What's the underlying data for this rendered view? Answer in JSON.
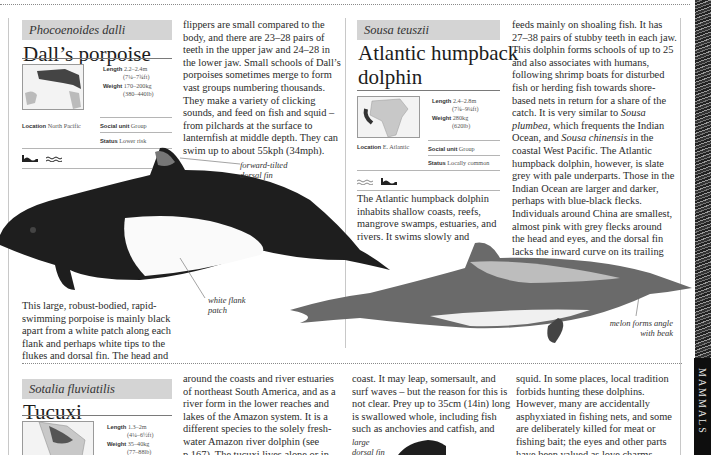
{
  "section_tab": "MAMMALS",
  "species": [
    {
      "scientific_name": "Phocoenoides dalli",
      "common_name": "Dall’s porpoise",
      "length_label": "Length",
      "length_value": "2.2–2.4m",
      "length_imperial": "(7¼–7¾ft)",
      "weight_label": "Weight",
      "weight_value": "170–200kg",
      "weight_imperial": "(380–440lb)",
      "location_label": "Location",
      "location_value": "North Pacific",
      "social_label": "Social unit",
      "social_value": "Group",
      "status_label": "Status",
      "status_value": "Lower risk",
      "habitat_icons": [
        "coast-icon",
        "open-sea-wave-icon"
      ],
      "text_left": "This large, robust-bodied, rapid-swimming porpoise is mainly black apart from a white patch along each flank and perhaps white tips to the flukes and dorsal fin. The head and",
      "text_right": "flippers are small compared to the body, and there are 23–28 pairs of teeth in the upper jaw and 24–28 in the lower jaw. Small schools of Dall’s porpoises sometimes merge to form vast groups numbering thousands. They make a variety of clicking sounds, and feed on fish and squid – from pilchards at the surface to lanternfish at middle depth. They can swim up to about 55kph (34mph).",
      "callouts": [
        "forward-tilted dorsal fin",
        "white flank patch"
      ]
    },
    {
      "scientific_name": "Sousa teuszii",
      "common_name_line1": "Atlantic humpback",
      "common_name_line2": "dolphin",
      "length_label": "Length",
      "length_value": "2.4–2.8m",
      "length_imperial": "(7¾–9¼ft)",
      "weight_label": "Weight",
      "weight_value": "280kg",
      "weight_imperial": "(620lb)",
      "location_label": "Location",
      "location_value": "E. Atlantic",
      "social_label": "Social unit",
      "social_value": "Group",
      "status_label": "Status",
      "status_value": "Locally common",
      "habitat_icons": [
        "open-sea-wave-icon",
        "coast-icon"
      ],
      "text_left": "The Atlantic humpback dolphin inhabits shallow coasts, reefs, mangrove swamps, estuaries, and rivers. It swims slowly and",
      "text_right_a": "feeds mainly on shoaling fish. It has 27–38 pairs of stubby teeth in each jaw. This dolphin forms schools of up to 25 and also associates with humans, following shrimp boats for disturbed fish or herding fish towards shore-based nets in return for a share of the catch. It is very similar to ",
      "text_right_i1": "Sousa plumbea",
      "text_right_b": ", which frequents the Indian Ocean, and ",
      "text_right_i2": "Sousa chinensis",
      "text_right_c": " in the coastal West Pacific. The Atlantic humpback dolphin, however, is slate grey with pale underparts. Those in the Indian Ocean are larger and darker, perhaps with blue-black flecks. Individuals around China are smallest, almost pink with grey flecks around the head and eyes, and the dorsal fin lacks the inward curve on its trailing edge.",
      "callouts": [
        "melon forms angle with beak"
      ]
    },
    {
      "scientific_name": "Sotalia fluviatilis",
      "common_name": "Tucuxi",
      "length_label": "Length",
      "length_value": "1.3–2m",
      "length_imperial": "(4¼–6½ft)",
      "weight_label": "Weight",
      "weight_value": "35–40kg",
      "weight_imperial": "(77–88lb)",
      "text_col1": "around the coasts and river estuaries of northeast South America, and as a river form in the lower reaches and lakes of the Amazon system. It is a different species to the solely fresh-water Amazon river dolphin (see p.167). The tucuxi lives alone or in",
      "text_col2": "coast. It may leap, somersault, and surf waves – but the reason for this is not clear. Prey up to 35cm (14in) long is swallowed whole, including fish such as anchovies and catfish, and",
      "text_col3": "squid. In some places, local tradition forbids hunting these dolphins. However, many are accidentally asphyxiated in fishing nets, and some are deliberately killed for meat or fishing bait; the eyes and other parts have been valued as love charms.",
      "callouts": [
        "large dorsal fin"
      ]
    }
  ]
}
